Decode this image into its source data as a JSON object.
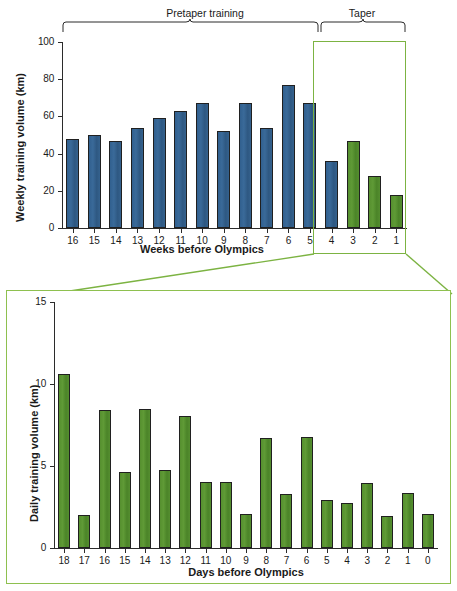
{
  "figure": {
    "panels": [
      "weekly-training-volume",
      "daily-training-volume"
    ]
  },
  "annotations": {
    "pretaper_label": "Pretaper training",
    "taper_label": "Taper"
  },
  "colors": {
    "blue_bar": "#35628e",
    "green_bar": "#55902f",
    "highlight_box": "#7cb342",
    "axis": "#2b2b2b"
  },
  "chart_data": [
    {
      "id": "weekly",
      "type": "bar",
      "title": "",
      "xlabel": "Weeks before Olympics",
      "ylabel": "Weekly training volume (km)",
      "ylim": [
        0,
        100
      ],
      "yticks": [
        0,
        20,
        40,
        60,
        80,
        100
      ],
      "ytick_labels": [
        "0",
        "20",
        "40",
        "60",
        "80",
        "100"
      ],
      "grid": false,
      "legend": null,
      "categories": [
        "16",
        "15",
        "14",
        "13",
        "12",
        "11",
        "10",
        "9",
        "8",
        "7",
        "6",
        "5",
        "4",
        "3",
        "2",
        "1"
      ],
      "values": [
        48,
        50,
        47,
        54,
        59,
        63,
        67,
        52,
        67,
        54,
        77,
        67,
        36,
        47,
        28,
        18
      ],
      "series": [
        {
          "name": "Pretaper training",
          "color": "#35628e",
          "categories": [
            "16",
            "15",
            "14",
            "13",
            "12",
            "11",
            "10",
            "9",
            "8",
            "7",
            "6",
            "5",
            "4"
          ],
          "values": [
            48,
            50,
            47,
            54,
            59,
            63,
            67,
            52,
            67,
            54,
            77,
            67,
            36
          ]
        },
        {
          "name": "Taper",
          "color": "#55902f",
          "categories": [
            "3",
            "2",
            "1"
          ],
          "values": [
            47,
            28,
            18
          ]
        }
      ]
    },
    {
      "id": "daily",
      "type": "bar",
      "title": "",
      "xlabel": "Days before Olympics",
      "ylabel": "Daily training volume (km)",
      "ylim": [
        0,
        15
      ],
      "yticks": [
        0,
        5,
        10,
        15
      ],
      "ytick_labels": [
        "0",
        "5",
        "10",
        "15"
      ],
      "grid": false,
      "legend": null,
      "categories": [
        "18",
        "17",
        "16",
        "15",
        "14",
        "13",
        "12",
        "11",
        "10",
        "9",
        "8",
        "7",
        "6",
        "5",
        "4",
        "3",
        "2",
        "1",
        "0"
      ],
      "values": [
        10.6,
        2.0,
        8.4,
        4.65,
        8.5,
        4.75,
        8.05,
        4.0,
        4.0,
        2.05,
        6.7,
        3.3,
        6.75,
        2.95,
        2.75,
        3.95,
        1.95,
        3.35,
        2.05
      ],
      "series": [
        {
          "name": "Taper daily volume",
          "color": "#55902f",
          "values": [
            10.6,
            2.0,
            8.4,
            4.65,
            8.5,
            4.75,
            8.05,
            4.0,
            4.0,
            2.05,
            6.7,
            3.3,
            6.75,
            2.95,
            2.75,
            3.95,
            1.95,
            3.35,
            2.05
          ]
        }
      ]
    }
  ]
}
